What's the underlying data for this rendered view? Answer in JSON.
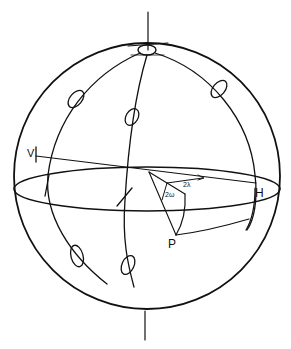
{
  "figure": {
    "type": "poincare-sphere-diagram",
    "colors": {
      "ink": "#111111",
      "background": "#ffffff"
    },
    "labels": {
      "V": "V",
      "H": "H",
      "P": "P",
      "two_lambda": "2λ",
      "two_omega": "2ω"
    },
    "elements": [
      "sphere-outline",
      "polar-axis",
      "equator-ellipse",
      "meridian-left",
      "meridian-center",
      "meridian-right",
      "pole-circle",
      "polarization-ellipses",
      "latitude-arc-through-P",
      "construction-lines"
    ]
  }
}
